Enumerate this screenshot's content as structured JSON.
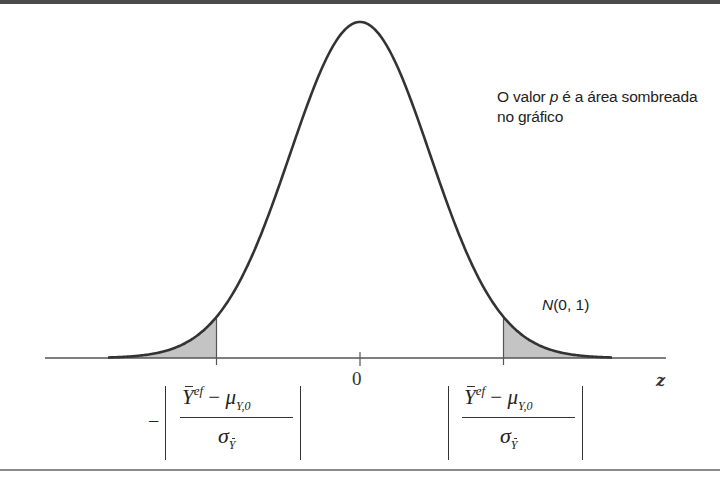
{
  "figure": {
    "annotation": {
      "line1_prefix": "O valor ",
      "line1_var": "p",
      "line1_suffix": " é a área sombreada",
      "line2": "no gráfico"
    },
    "distribution_label": {
      "name": "N",
      "params": "(0, 1)"
    },
    "axis": {
      "variable": "z",
      "center_tick": "0"
    },
    "left_cutoff": {
      "sign": "−",
      "numerator_var": "Y",
      "numerator_sup": "ef",
      "numerator_op": " − ",
      "numerator_mu": "μ",
      "numerator_mu_sub": "Y,0",
      "denominator_var": "σ",
      "denominator_sub": "Y"
    },
    "right_cutoff": {
      "numerator_var": "Y",
      "numerator_sup": "ef",
      "numerator_op": " − ",
      "numerator_mu": "μ",
      "numerator_mu_sub": "Y,0",
      "denominator_var": "σ",
      "denominator_sub": "Y"
    },
    "colors": {
      "curve": "#333333",
      "shade": "#c4c4c4",
      "axis": "#555555",
      "border": "#4a4a4a"
    }
  },
  "chart_data": {
    "type": "area",
    "title": "",
    "distribution": "normal",
    "mean": 0,
    "sd": 1,
    "xlabel": "z",
    "ylabel": "",
    "x_ticks": [
      "0"
    ],
    "x_range_approx": [
      -3.6,
      3.6
    ],
    "shaded_regions": [
      {
        "from": "-inf",
        "to": -2.05,
        "label": "−|(Ȳ^ef − μ_Y,0)/σ_Ȳ|"
      },
      {
        "from": 2.05,
        "to": "inf",
        "label": "|(Ȳ^ef − μ_Y,0)/σ_Ȳ|"
      }
    ],
    "annotations": [
      "O valor p é a área sombreada no gráfico",
      "N(0, 1)"
    ],
    "grid": false,
    "legend": "none"
  }
}
